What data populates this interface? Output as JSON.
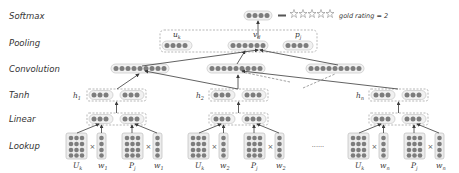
{
  "diagram": {
    "type": "neural-network-architecture",
    "layers": [
      {
        "id": "softmax",
        "label": "Softmax"
      },
      {
        "id": "pooling",
        "label": "Pooling"
      },
      {
        "id": "convolution",
        "label": "Convolution"
      },
      {
        "id": "tanh",
        "label": "Tanh"
      },
      {
        "id": "linear",
        "label": "Linear"
      },
      {
        "id": "lookup",
        "label": "Lookup"
      }
    ],
    "softmax": {
      "output_dots": 4,
      "stars_count": 5,
      "note": "gold rating = 2"
    },
    "pooling": {
      "vectors": [
        {
          "label": "u",
          "sub": "k",
          "dots": 4
        },
        {
          "label": "v",
          "sub": "d",
          "dots": 6
        },
        {
          "label": "p",
          "sub": "j",
          "dots": 4
        }
      ]
    },
    "convolution": {
      "units": 3,
      "dots_per_unit": 9
    },
    "tanh": {
      "hidden": [
        {
          "label": "h",
          "sub": "1"
        },
        {
          "label": "h",
          "sub": "2"
        },
        {
          "label": "h",
          "sub": "n"
        }
      ]
    },
    "lookup": {
      "groups": [
        {
          "matrix": {
            "label": "U",
            "sub": "k"
          },
          "vector": {
            "label": "w",
            "sub": "1"
          }
        },
        {
          "matrix": {
            "label": "P",
            "sub": "j"
          },
          "vector": {
            "label": "w",
            "sub": "1"
          }
        },
        {
          "matrix": {
            "label": "U",
            "sub": "k"
          },
          "vector": {
            "label": "w",
            "sub": "2"
          }
        },
        {
          "matrix": {
            "label": "P",
            "sub": "j"
          },
          "vector": {
            "label": "w",
            "sub": "2"
          }
        },
        {
          "matrix": {
            "label": "U",
            "sub": "k"
          },
          "vector": {
            "label": "w",
            "sub": "n"
          }
        },
        {
          "matrix": {
            "label": "P",
            "sub": "j"
          },
          "vector": {
            "label": "w",
            "sub": "n"
          }
        }
      ],
      "times_symbol": "×",
      "ellipsis": "......"
    },
    "colors": {
      "dot": "#7d7d7d",
      "vector_fill": "#f1f1f1",
      "border": "#c6c6c6",
      "arrow": "#3a3a3a",
      "text": "#333333"
    }
  }
}
